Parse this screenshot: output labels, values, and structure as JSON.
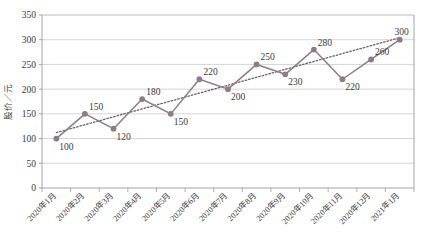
{
  "chart_data": {
    "type": "line",
    "title": "",
    "xlabel": "",
    "ylabel": "股价／元",
    "ylim": [
      0,
      350
    ],
    "yticks": [
      0,
      50,
      100,
      150,
      200,
      250,
      300,
      350
    ],
    "grid": true,
    "legend": "none",
    "categories": [
      "2020年1月",
      "2020年2月",
      "2020年3月",
      "2020年4月",
      "2020年5月",
      "2020年6月",
      "2020年7月",
      "2020年8月",
      "2020年9月",
      "2020年10月",
      "2020年11月",
      "2020年12月",
      "2021年1月"
    ],
    "series": [
      {
        "name": "股价",
        "values": [
          100,
          150,
          120,
          180,
          150,
          220,
          200,
          250,
          230,
          280,
          220,
          260,
          300
        ],
        "color": "#8d7c86",
        "marker": "circle",
        "data_labels": [
          "100",
          "150",
          "120",
          "180",
          "150",
          "220",
          "200",
          "250",
          "230",
          "280",
          "220",
          "260",
          "300"
        ]
      },
      {
        "name": "趋势线",
        "type": "trendline-linear",
        "values": [
          112,
          128,
          144,
          160,
          176,
          192,
          208,
          224,
          240,
          256,
          272,
          288,
          304
        ],
        "color": "#6f6068",
        "style": "dotted"
      }
    ],
    "colors": {
      "line": "#8d7c86",
      "marker": "#8d7c86",
      "trendline": "#6f6068",
      "grid": "#c9c9c9",
      "axis": "#9a9a9a",
      "text": "#3a3a3a",
      "background": "#ffffff"
    }
  }
}
